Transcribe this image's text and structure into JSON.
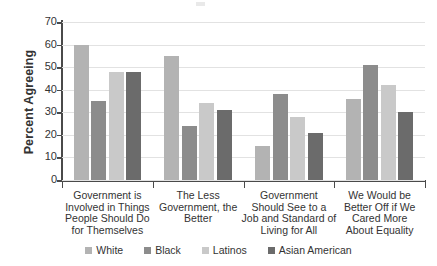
{
  "chart_data": {
    "type": "bar",
    "title": "",
    "subtitle": "",
    "xlabel": "",
    "ylabel": "Percent Agreeing",
    "ylim": [
      0,
      70
    ],
    "ytick_step": 10,
    "yticks": [
      70,
      60,
      50,
      40,
      30,
      20,
      10,
      0
    ],
    "grid": true,
    "legend_position": "bottom",
    "categories": [
      "Government is Involved in Things People Should Do for Themselves",
      "The Less Government, the Better",
      "Government Should See to a Job and Standard of Living for All",
      "We Would be Better Off if We Cared More About Equality"
    ],
    "category_lines": [
      [
        "Government is",
        "Involved in Things",
        "People Should Do",
        "for Themselves"
      ],
      [
        "The Less",
        "Government, the",
        "Better"
      ],
      [
        "Government",
        "Should See to a",
        "Job and Standard of",
        "Living for All"
      ],
      [
        "We Would be",
        "Better Off if We",
        "Cared More",
        "About Equality"
      ]
    ],
    "series": [
      {
        "name": "White",
        "color": "#b3b3b3",
        "values": [
          60,
          55,
          15,
          36
        ]
      },
      {
        "name": "Black",
        "color": "#8c8c8c",
        "values": [
          35,
          24,
          38,
          51
        ]
      },
      {
        "name": "Latinos",
        "color": "#c9c9c9",
        "values": [
          48,
          34,
          28,
          42
        ]
      },
      {
        "name": "Asian American",
        "color": "#6b6b6b",
        "values": [
          48,
          31,
          21,
          30
        ]
      }
    ]
  }
}
